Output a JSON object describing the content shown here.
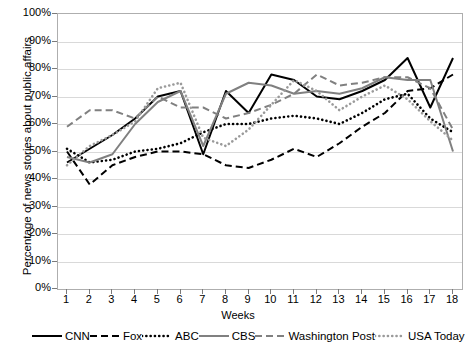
{
  "chart_data": {
    "type": "line",
    "title": "",
    "xlabel": "Weeks",
    "ylabel": "Percentage of news stories about public affairs",
    "x": [
      1,
      2,
      3,
      4,
      5,
      6,
      7,
      8,
      9,
      10,
      11,
      12,
      13,
      14,
      15,
      16,
      17,
      18
    ],
    "x_tick_labels": [
      "1",
      "2",
      "3",
      "4",
      "5",
      "6",
      "7",
      "8",
      "9",
      "10",
      "11",
      "12",
      "13",
      "14",
      "15",
      "16",
      "17",
      "18"
    ],
    "y_tick_labels": [
      "0%",
      "10%",
      "20%",
      "30%",
      "40%",
      "50%",
      "60%",
      "70%",
      "80%",
      "90%",
      "100%"
    ],
    "y_tick_values": [
      0,
      10,
      20,
      30,
      40,
      50,
      60,
      70,
      80,
      90,
      100
    ],
    "ylim": [
      0,
      100
    ],
    "xlim": [
      1,
      18
    ],
    "grid": "horizontal",
    "legend_position": "bottom",
    "series": [
      {
        "name": "CNN",
        "color": "#000000",
        "style": "solid",
        "values": [
          46,
          51,
          56,
          62,
          70,
          72,
          49,
          72,
          64,
          78,
          76,
          70,
          69,
          72,
          76,
          84,
          66,
          84
        ]
      },
      {
        "name": "Fox",
        "color": "#000000",
        "style": "dashed",
        "values": [
          50,
          38,
          45,
          48,
          50,
          50,
          49,
          45,
          44,
          47,
          51,
          48,
          53,
          59,
          64,
          72,
          73,
          78
        ]
      },
      {
        "name": "ABC",
        "color": "#000000",
        "style": "dotted",
        "values": [
          51,
          46,
          47,
          50,
          51,
          53,
          57,
          60,
          60,
          62,
          63,
          62,
          60,
          64,
          69,
          71,
          62,
          57
        ]
      },
      {
        "name": "CBS",
        "color": "#808080",
        "style": "solid",
        "values": [
          48,
          46,
          49,
          60,
          68,
          72,
          52,
          71,
          75,
          74,
          71,
          72,
          71,
          73,
          77,
          76,
          76,
          50
        ]
      },
      {
        "name": "Washington Post",
        "color": "#808080",
        "style": "dashed",
        "values": [
          59,
          65,
          65,
          62,
          70,
          66,
          66,
          62,
          64,
          67,
          71,
          78,
          74,
          75,
          77,
          77,
          73,
          58
        ]
      },
      {
        "name": "USA Today",
        "color": "#9a9a9a",
        "style": "dotted",
        "values": [
          45,
          52,
          56,
          61,
          73,
          75,
          55,
          52,
          58,
          67,
          76,
          72,
          65,
          70,
          74,
          69,
          61,
          54
        ]
      }
    ]
  },
  "axis": {
    "x_title": "Weeks",
    "y_title": "Percentage of news stories about public affairs"
  }
}
